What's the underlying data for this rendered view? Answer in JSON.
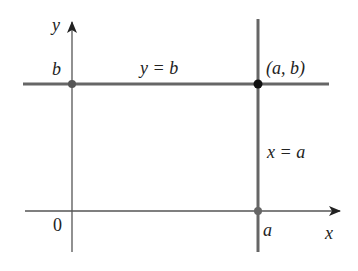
{
  "diagram": {
    "type": "coordinate-plane",
    "axes": {
      "x_label": "x",
      "y_label": "y",
      "origin_label": "0"
    },
    "lines": [
      {
        "id": "horizontal",
        "equation_label": "y = b",
        "y_tick_label": "b"
      },
      {
        "id": "vertical",
        "equation_label": "x = a",
        "x_tick_label": "a"
      }
    ],
    "intersection": {
      "label": "(a, b)"
    },
    "colors": {
      "axis": "#555555",
      "line": "#666666",
      "point": "#111111",
      "tick_point": "#666666",
      "text": "#222222"
    }
  }
}
